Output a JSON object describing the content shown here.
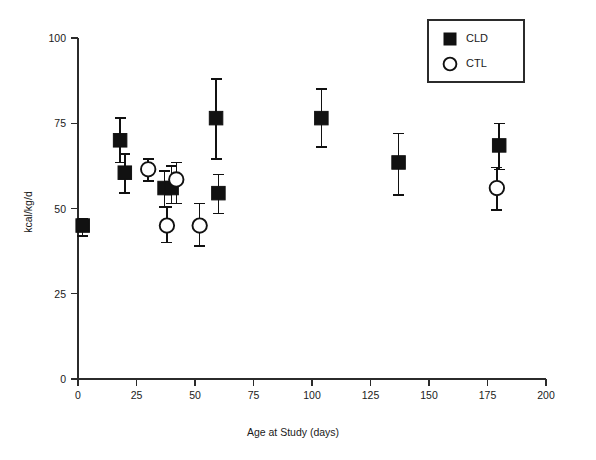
{
  "chart_data": {
    "type": "scatter",
    "title": "",
    "xlabel": "Age at Study (days)",
    "ylabel": "kcal/kg/d",
    "xlim": [
      0,
      200
    ],
    "ylim": [
      0,
      100
    ],
    "xticks": [
      0,
      25,
      50,
      75,
      100,
      125,
      150,
      175,
      200
    ],
    "xticklabels": [
      "0",
      "25",
      "50",
      "75",
      "100",
      "125",
      "150",
      "175",
      "200"
    ],
    "yticks": [
      0,
      25,
      50,
      75,
      100
    ],
    "yticklabels": [
      "0",
      "25",
      "50",
      "75",
      "100"
    ],
    "grid": false,
    "legend_position": "top-right",
    "error_bars": "vertical",
    "series": [
      {
        "name": "CLD",
        "marker": "filled-square",
        "color": "#111111",
        "points": [
          {
            "x": 2,
            "y": 45.0,
            "yerr_low": 3.0,
            "yerr_high": 2.0
          },
          {
            "x": 18,
            "y": 70.0,
            "yerr_low": 6.5,
            "yerr_high": 6.5
          },
          {
            "x": 20,
            "y": 60.5,
            "yerr_low": 6.0,
            "yerr_high": 5.5
          },
          {
            "x": 37,
            "y": 56.0,
            "yerr_low": 5.5,
            "yerr_high": 5.0
          },
          {
            "x": 40,
            "y": 56.0,
            "yerr_low": 4.5,
            "yerr_high": 6.5
          },
          {
            "x": 59,
            "y": 76.5,
            "yerr_low": 12.0,
            "yerr_high": 11.5
          },
          {
            "x": 60,
            "y": 54.5,
            "yerr_low": 6.0,
            "yerr_high": 5.5
          },
          {
            "x": 104,
            "y": 76.5,
            "yerr_low": 8.5,
            "yerr_high": 8.5
          },
          {
            "x": 137,
            "y": 63.5,
            "yerr_low": 9.5,
            "yerr_high": 8.5
          },
          {
            "x": 180,
            "y": 68.5,
            "yerr_low": 7.0,
            "yerr_high": 6.5
          }
        ]
      },
      {
        "name": "CTL",
        "marker": "open-circle",
        "color": "#111111",
        "points": [
          {
            "x": 30,
            "y": 61.5,
            "yerr_low": 3.5,
            "yerr_high": 3.0
          },
          {
            "x": 38,
            "y": 45.0,
            "yerr_low": 5.0,
            "yerr_high": 5.5
          },
          {
            "x": 42,
            "y": 58.5,
            "yerr_low": 7.0,
            "yerr_high": 5.0
          },
          {
            "x": 52,
            "y": 45.0,
            "yerr_low": 6.0,
            "yerr_high": 6.5
          },
          {
            "x": 179,
            "y": 56.0,
            "yerr_low": 6.5,
            "yerr_high": 6.0
          }
        ]
      }
    ]
  },
  "legend": {
    "entries": [
      {
        "label": "CLD",
        "marker": "filled-square"
      },
      {
        "label": "CTL",
        "marker": "open-circle"
      }
    ]
  },
  "axes": {
    "x_title": "Age at Study (days)",
    "y_title": "kcal/kg/d"
  }
}
